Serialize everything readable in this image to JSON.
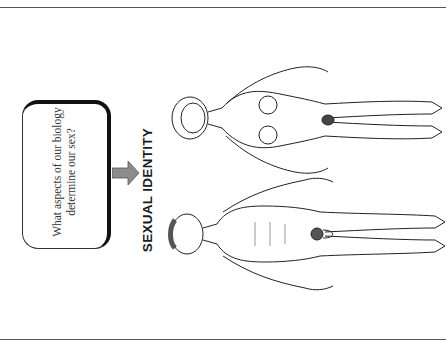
{
  "question_box": {
    "text": "What aspects of our biology determine our sex?"
  },
  "title": "SEXUAL IDENTITY",
  "figures": [
    {
      "id": "female",
      "label": "female-figure"
    },
    {
      "id": "male",
      "label": "male-figure"
    }
  ],
  "colors": {
    "rule": "#555555",
    "box_border": "#111111",
    "arrow_fill": "#8c8c8c",
    "line_art": "#222222"
  }
}
